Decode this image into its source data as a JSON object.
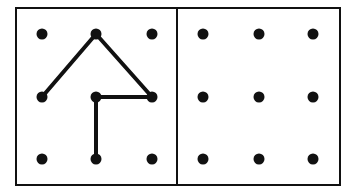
{
  "diagram": {
    "colors": {
      "line": "#111111",
      "dot": "#111111",
      "background": "#ffffff"
    },
    "grid_columns_left": [
      42,
      96,
      152
    ],
    "grid_columns_right": [
      203,
      259,
      313
    ],
    "grid_rows": [
      34,
      97,
      159
    ],
    "left_panel_segments": [
      {
        "from": [
          0,
          1
        ],
        "to": [
          1,
          0
        ]
      },
      {
        "from": [
          1,
          0
        ],
        "to": [
          2,
          1
        ]
      },
      {
        "from": [
          2,
          1
        ],
        "to": [
          1,
          1
        ]
      },
      {
        "from": [
          1,
          1
        ],
        "to": [
          1,
          2
        ]
      }
    ],
    "right_panel_segments": []
  }
}
